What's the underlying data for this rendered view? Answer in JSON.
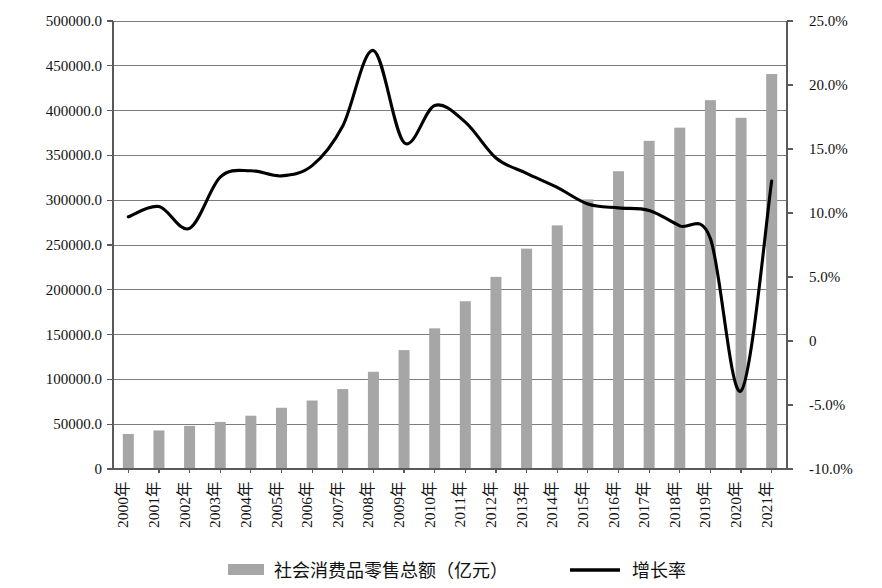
{
  "chart_data": {
    "type": "bar",
    "title": "",
    "subtitle": "",
    "xlabel": "",
    "ylabel": "",
    "grid": true,
    "legend_position": "bottom",
    "categories": [
      "2000年",
      "2001年",
      "2002年",
      "2003年",
      "2004年",
      "2005年",
      "2006年",
      "2007年",
      "2008年",
      "2009年",
      "2010年",
      "2011年",
      "2012年",
      "2013年",
      "2014年",
      "2015年",
      "2016年",
      "2017年",
      "2018年",
      "2019年",
      "2020年",
      "2021年"
    ],
    "axes": {
      "left": {
        "label": "",
        "min": 0,
        "max": 500000,
        "step": 50000,
        "ticks": [
          "0",
          "50000.0",
          "100000.0",
          "150000.0",
          "200000.0",
          "250000.0",
          "300000.0",
          "350000.0",
          "400000.0",
          "450000.0",
          "500000.0"
        ]
      },
      "right": {
        "label": "",
        "min": -10,
        "max": 25,
        "step": 5,
        "ticks": [
          "-10.0%",
          "-5.0%",
          "0",
          "5.0%",
          "10.0%",
          "15.0%",
          "20.0%",
          "25.0%"
        ]
      }
    },
    "series": [
      {
        "name": "社会消费品零售总额（亿元）",
        "type": "bar",
        "axis": "left",
        "color": "#a6a6a6",
        "values": [
          39106,
          43055,
          48136,
          52516,
          59501,
          68353,
          76410,
          89210,
          108488,
          132678,
          156998,
          187206,
          214433,
          245903,
          271896,
          300931,
          332316,
          366262,
          380987,
          411649,
          391981,
          440823
        ]
      },
      {
        "name": "增长率",
        "type": "line",
        "axis": "right",
        "color": "#000000",
        "values": [
          9.7,
          10.5,
          8.8,
          12.8,
          13.3,
          12.9,
          13.7,
          16.8,
          22.7,
          15.5,
          18.4,
          17.1,
          14.3,
          13.1,
          12.0,
          10.7,
          10.4,
          10.2,
          9.0,
          8.0,
          -3.9,
          12.5
        ]
      }
    ]
  },
  "legend": {
    "items": [
      {
        "label": "社会消费品零售总额（亿元）",
        "marker": "bar-swatch",
        "color": "#a6a6a6"
      },
      {
        "label": "增长率",
        "marker": "line-swatch",
        "color": "#000000"
      }
    ]
  }
}
